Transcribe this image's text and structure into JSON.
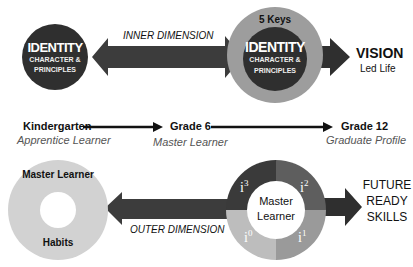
{
  "top": {
    "left_circle": {
      "title": "IDENTITY",
      "line1": "CHARACTER &",
      "line2": "PRINCIPLES"
    },
    "arrow_label": "INNER DIMENSION",
    "right_circle": {
      "ring_label": "5 Keys",
      "title": "IDENTITY",
      "line1": "CHARACTER &",
      "line2": "PRINCIPLES"
    },
    "vision": {
      "title": "VISION",
      "subtitle": "Led Life"
    }
  },
  "timeline": {
    "stages": [
      {
        "grade": "Kindergarten",
        "role": "Apprentice Learner"
      },
      {
        "grade": "Grade 6",
        "role": "Master Learner"
      },
      {
        "grade": "Grade 12",
        "role": "Graduate Profile"
      }
    ]
  },
  "bottom": {
    "left_donut": {
      "top_label": "Master Learner",
      "bottom_label": "Habits"
    },
    "arrow_label": "OUTER DIMENSION",
    "right_donut": {
      "center_line1": "Master",
      "center_line2": "Learner",
      "quadrants": [
        {
          "base": "i",
          "sup": "3",
          "position": "top-left",
          "color": "#3a3a3a"
        },
        {
          "base": "i",
          "sup": "2",
          "position": "top-right",
          "color": "#5e5e5e"
        },
        {
          "base": "i",
          "sup": "1",
          "position": "bottom-right",
          "color": "#9a9a9a"
        },
        {
          "base": "i",
          "sup": "0",
          "position": "bottom-left",
          "color": "#bdbdbd"
        }
      ]
    },
    "future": {
      "line1": "FUTURE",
      "line2": "READY",
      "line3": "SKILLS"
    }
  },
  "colors": {
    "dark": "#2f2f2f",
    "arrow": "#3c3c3c",
    "ring": "#9d9d9d",
    "light": "#d0d0d0"
  }
}
